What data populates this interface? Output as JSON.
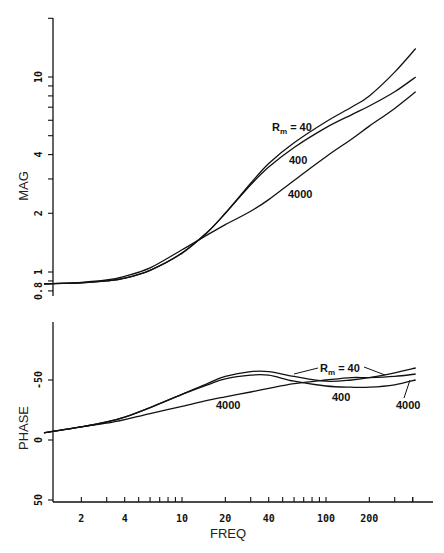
{
  "chart_data": [
    {
      "type": "line",
      "title": "",
      "xlabel": "FREQ",
      "ylabel": "MAG",
      "xscale": "log",
      "yscale": "log",
      "xlim": [
        1.1,
        420
      ],
      "ylim": [
        0.78,
        20
      ],
      "grid": false,
      "x_ticks": [
        2,
        4,
        10,
        20,
        40,
        100,
        200
      ],
      "y_ticks": [
        0.8,
        1,
        2,
        4,
        10
      ],
      "y_tick_labels": [
        "0.8",
        "1",
        "2",
        "4",
        "10"
      ],
      "x": [
        1.1,
        2,
        3,
        4,
        6,
        10,
        15,
        20,
        30,
        40,
        60,
        100,
        150,
        200,
        300,
        420
      ],
      "series": [
        {
          "name": "Rm = 40",
          "values": [
            0.87,
            0.88,
            0.9,
            0.93,
            1.02,
            1.25,
            1.6,
            2.0,
            2.85,
            3.6,
            4.6,
            5.9,
            7.0,
            8.0,
            10.6,
            14.0
          ]
        },
        {
          "name": "Rm = 400",
          "values": [
            0.87,
            0.88,
            0.9,
            0.93,
            1.02,
            1.25,
            1.6,
            2.0,
            2.8,
            3.45,
            4.35,
            5.5,
            6.4,
            7.1,
            8.4,
            10.0
          ]
        },
        {
          "name": "Rm = 4000",
          "values": [
            0.87,
            0.885,
            0.91,
            0.95,
            1.05,
            1.3,
            1.55,
            1.75,
            2.05,
            2.35,
            2.95,
            3.9,
            4.8,
            5.6,
            6.9,
            8.4
          ]
        }
      ],
      "annotations": [
        "Rm = 40",
        "400",
        "4000"
      ]
    },
    {
      "type": "line",
      "title": "",
      "xlabel": "FREQ",
      "ylabel": "PHASE",
      "xscale": "log",
      "yscale": "linear",
      "xlim": [
        1.1,
        420
      ],
      "ylim": [
        -50,
        90
      ],
      "grid": false,
      "x_ticks": [
        2,
        4,
        10,
        20,
        40,
        100,
        200
      ],
      "y_ticks": [
        -50,
        0,
        50
      ],
      "x": [
        1.1,
        2,
        3,
        4,
        6,
        10,
        15,
        20,
        30,
        40,
        60,
        100,
        150,
        200,
        300,
        420
      ],
      "series": [
        {
          "name": "Rm = 40",
          "values": [
            6,
            11,
            15,
            19,
            27,
            38,
            47,
            53,
            57,
            57,
            53,
            49,
            50,
            52,
            56,
            60
          ]
        },
        {
          "name": "Rm = 400",
          "values": [
            6,
            11,
            15,
            19,
            27,
            38,
            46,
            51,
            54,
            54,
            49,
            45,
            44,
            44,
            46,
            50
          ]
        },
        {
          "name": "Rm = 4000",
          "values": [
            6,
            11,
            14,
            17,
            22,
            28,
            33,
            36,
            40,
            43,
            47,
            50,
            52,
            52,
            53,
            55
          ]
        }
      ],
      "annotations": [
        "Rm = 40",
        "400",
        "4000",
        "4000"
      ]
    }
  ],
  "labels": {
    "mag_axis": "MAG",
    "phase_axis": "PHASE",
    "freq_axis": "FREQ",
    "x_ticks": [
      "2",
      "4",
      "10",
      "20",
      "40",
      "100",
      "200"
    ],
    "mag_ticks": [
      "0.8",
      "1",
      "2",
      "4",
      "10"
    ],
    "phase_ticks": [
      "50",
      "0",
      "-50"
    ],
    "mag_annot_rm_prefix": "R",
    "mag_annot_rm_sub": "m",
    "mag_annot_rm_eq": " = 40",
    "mag_annot_400": "400",
    "mag_annot_4000": "4000",
    "phase_annot_rm_prefix": "R",
    "phase_annot_rm_sub": "m",
    "phase_annot_rm_eq": " = 40",
    "phase_annot_400": "400",
    "phase_annot_4000_left": "4000",
    "phase_annot_4000_right": "4000"
  }
}
